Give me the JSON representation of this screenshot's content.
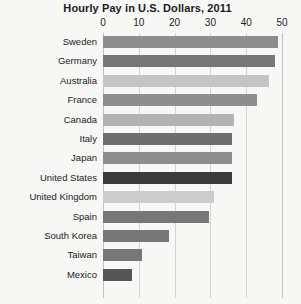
{
  "chart_data": {
    "type": "bar",
    "orientation": "horizontal",
    "title": "Hourly Pay in U.S. Dollars, 2011",
    "xlabel": "",
    "ylabel": "",
    "xlim": [
      0,
      50
    ],
    "xticks": [
      0,
      10,
      20,
      30,
      40,
      50
    ],
    "xtick_labels": [
      "0",
      "10",
      "20",
      "30",
      "40",
      "50"
    ],
    "grid": true,
    "legend": "none",
    "categories": [
      "Sweden",
      "Germany",
      "Australia",
      "France",
      "Canada",
      "Italy",
      "Japan",
      "United States",
      "United Kingdom",
      "Spain",
      "South Korea",
      "Taiwan",
      "Mexico"
    ],
    "values": [
      49,
      48,
      46.5,
      43,
      36.5,
      36,
      36,
      36,
      31,
      29.5,
      18.5,
      11,
      8
    ],
    "highlight_category": "United States",
    "bar_colors": [
      "#8e8e8e",
      "#777777",
      "#c4c4c4",
      "#8e8e8e",
      "#b3b3b3",
      "#6e6e6e",
      "#8e8e8e",
      "#3a3a3a",
      "#cccccc",
      "#777777",
      "#777777",
      "#777777",
      "#555555"
    ]
  },
  "colors": {
    "background": "#f7f7f5",
    "text": "#1c1c1c",
    "gridline": "#d3d3d1",
    "axis": "#c2c2c0",
    "highlight": "#3a3a3a"
  }
}
